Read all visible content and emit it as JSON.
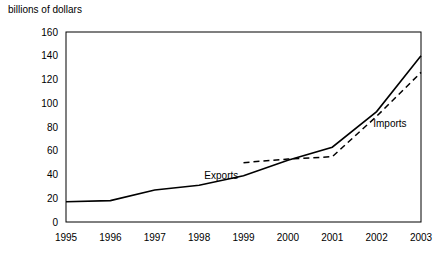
{
  "chart_data": {
    "type": "line",
    "title": "",
    "subtitle": "",
    "ylabel": "billions of dollars",
    "xlabel": "",
    "grid": false,
    "legend_position": "inline-annotations",
    "x": [
      "1995",
      "1996",
      "1997",
      "1998",
      "1999",
      "2000",
      "2001",
      "2002",
      "2003"
    ],
    "ylim": [
      0,
      160
    ],
    "yticks": [
      0,
      20,
      40,
      60,
      80,
      100,
      120,
      140,
      160
    ],
    "series": [
      {
        "name": "Exports",
        "style": "solid",
        "x": [
          "1995",
          "1996",
          "1997",
          "1998",
          "1999",
          "2000",
          "2001",
          "2002",
          "2003"
        ],
        "values": [
          17,
          18,
          27,
          31,
          39,
          52,
          63,
          93,
          140
        ]
      },
      {
        "name": "Imports",
        "style": "dashed",
        "x": [
          "1999",
          "2000",
          "2001",
          "2002",
          "2003"
        ],
        "values": [
          50,
          53,
          55,
          89,
          126
        ]
      }
    ],
    "annotations": [
      {
        "text": "Exports",
        "x": "1998.5",
        "y": 36
      },
      {
        "text": "Imports",
        "x": "2002.3",
        "y": 80
      }
    ],
    "colors": {
      "line": "#000000",
      "axis": "#000000",
      "background": "#ffffff"
    }
  }
}
